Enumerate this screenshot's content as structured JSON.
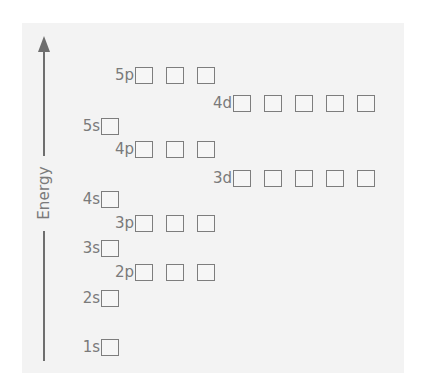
{
  "diagram": {
    "title": "",
    "axis": {
      "label": "Energy",
      "direction": "up"
    },
    "orbitals": [
      {
        "id": "1s",
        "label": "1s",
        "boxes": 1,
        "x": 76,
        "y": 347
      },
      {
        "id": "2s",
        "label": "2s",
        "boxes": 1,
        "x": 76,
        "y": 298
      },
      {
        "id": "2p",
        "label": "2p",
        "boxes": 3,
        "x": 110,
        "y": 272
      },
      {
        "id": "3s",
        "label": "3s",
        "boxes": 1,
        "x": 76,
        "y": 248
      },
      {
        "id": "3p",
        "label": "3p",
        "boxes": 3,
        "x": 110,
        "y": 223
      },
      {
        "id": "4s",
        "label": "4s",
        "boxes": 1,
        "x": 76,
        "y": 199
      },
      {
        "id": "3d",
        "label": "3d",
        "boxes": 5,
        "x": 208,
        "y": 178
      },
      {
        "id": "4p",
        "label": "4p",
        "boxes": 3,
        "x": 110,
        "y": 149
      },
      {
        "id": "5s",
        "label": "5s",
        "boxes": 1,
        "x": 76,
        "y": 126
      },
      {
        "id": "4d",
        "label": "4d",
        "boxes": 5,
        "x": 208,
        "y": 103
      },
      {
        "id": "5p",
        "label": "5p",
        "boxes": 3,
        "x": 110,
        "y": 75
      }
    ],
    "colors": {
      "panel_bg": "#f3f3f3",
      "stroke": "#7d7d7d",
      "text": "#7a7a7a"
    }
  }
}
